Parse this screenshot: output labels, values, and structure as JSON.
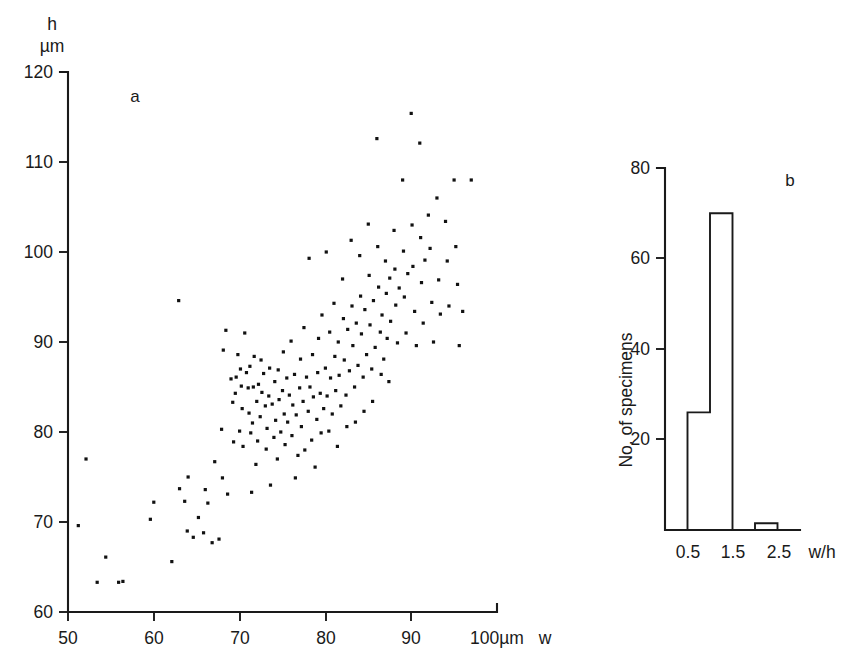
{
  "figure": {
    "background": "#ffffff",
    "ink": "#1a1a1a"
  },
  "panel_a": {
    "label": "a",
    "y_axis_name": "h",
    "y_axis_unit": "µm",
    "x_axis_unit_label": "100µm",
    "x_axis_name": "w",
    "y_ticks": [
      "120",
      "110",
      "100",
      "90",
      "80",
      "70",
      "60"
    ],
    "x_ticks": [
      "50",
      "60",
      "70",
      "80",
      "90"
    ]
  },
  "panel_b": {
    "label": "b",
    "y_axis_title": "No. of specimens",
    "x_axis_name": "w/h",
    "y_ticks": [
      "80",
      "60",
      "40",
      "20"
    ],
    "x_ticks": [
      "0.5",
      "1.5",
      "2.5"
    ]
  },
  "chart_data": [
    {
      "type": "scatter",
      "panel": "a",
      "title": "a",
      "xlabel": "w",
      "ylabel": "h",
      "xunit": "µm",
      "yunit": "µm",
      "xlim": [
        50,
        100
      ],
      "ylim": [
        60,
        120
      ],
      "xticks": [
        50,
        60,
        70,
        80,
        90,
        100
      ],
      "yticks": [
        60,
        70,
        80,
        90,
        100,
        110,
        120
      ],
      "grid": false,
      "legend": "none",
      "marker": "small filled square",
      "n_points": 196,
      "points": [
        [
          51.2,
          69.6
        ],
        [
          52.1,
          77.0
        ],
        [
          53.4,
          63.3
        ],
        [
          54.4,
          66.1
        ],
        [
          55.9,
          63.3
        ],
        [
          56.4,
          63.4
        ],
        [
          59.6,
          70.3
        ],
        [
          60.0,
          72.2
        ],
        [
          62.1,
          65.6
        ],
        [
          62.9,
          94.6
        ],
        [
          63.0,
          73.7
        ],
        [
          63.6,
          72.3
        ],
        [
          63.9,
          69.0
        ],
        [
          64.0,
          75.0
        ],
        [
          64.6,
          68.3
        ],
        [
          65.2,
          70.5
        ],
        [
          65.8,
          68.8
        ],
        [
          66.0,
          73.6
        ],
        [
          66.3,
          72.1
        ],
        [
          66.8,
          67.7
        ],
        [
          67.1,
          76.7
        ],
        [
          67.6,
          68.1
        ],
        [
          67.9,
          80.3
        ],
        [
          68.0,
          74.9
        ],
        [
          68.1,
          89.1
        ],
        [
          68.4,
          91.3
        ],
        [
          68.6,
          73.1
        ],
        [
          69.0,
          85.9
        ],
        [
          69.2,
          83.3
        ],
        [
          69.3,
          78.9
        ],
        [
          69.5,
          84.3
        ],
        [
          69.6,
          86.1
        ],
        [
          69.8,
          88.6
        ],
        [
          70.0,
          80.1
        ],
        [
          70.1,
          87.0
        ],
        [
          70.2,
          85.1
        ],
        [
          70.3,
          82.6
        ],
        [
          70.4,
          78.4
        ],
        [
          70.6,
          91.0
        ],
        [
          70.8,
          86.6
        ],
        [
          71.0,
          84.9
        ],
        [
          71.1,
          82.1
        ],
        [
          71.2,
          87.3
        ],
        [
          71.3,
          79.9
        ],
        [
          71.4,
          73.3
        ],
        [
          71.5,
          81.0
        ],
        [
          71.6,
          85.0
        ],
        [
          71.7,
          88.4
        ],
        [
          71.9,
          76.4
        ],
        [
          72.0,
          83.4
        ],
        [
          72.1,
          79.0
        ],
        [
          72.2,
          85.3
        ],
        [
          72.4,
          81.7
        ],
        [
          72.5,
          88.0
        ],
        [
          72.6,
          84.4
        ],
        [
          72.8,
          86.5
        ],
        [
          73.0,
          82.9
        ],
        [
          73.1,
          78.1
        ],
        [
          73.2,
          80.4
        ],
        [
          73.4,
          84.0
        ],
        [
          73.5,
          87.1
        ],
        [
          73.6,
          74.1
        ],
        [
          73.8,
          83.1
        ],
        [
          74.0,
          79.4
        ],
        [
          74.1,
          85.6
        ],
        [
          74.2,
          81.3
        ],
        [
          74.4,
          77.0
        ],
        [
          74.5,
          86.9
        ],
        [
          74.6,
          83.6
        ],
        [
          74.8,
          80.0
        ],
        [
          75.0,
          84.6
        ],
        [
          75.1,
          88.9
        ],
        [
          75.2,
          82.0
        ],
        [
          75.3,
          78.6
        ],
        [
          75.5,
          86.0
        ],
        [
          75.6,
          81.1
        ],
        [
          75.8,
          84.1
        ],
        [
          76.0,
          90.1
        ],
        [
          76.1,
          79.6
        ],
        [
          76.2,
          83.0
        ],
        [
          76.4,
          86.4
        ],
        [
          76.5,
          74.9
        ],
        [
          76.6,
          81.9
        ],
        [
          76.8,
          77.4
        ],
        [
          77.0,
          84.9
        ],
        [
          77.1,
          88.1
        ],
        [
          77.2,
          80.6
        ],
        [
          77.4,
          83.4
        ],
        [
          77.5,
          91.6
        ],
        [
          77.6,
          78.0
        ],
        [
          77.8,
          86.1
        ],
        [
          78.0,
          82.3
        ],
        [
          78.1,
          99.3
        ],
        [
          78.2,
          85.0
        ],
        [
          78.4,
          79.1
        ],
        [
          78.5,
          88.6
        ],
        [
          78.6,
          83.9
        ],
        [
          78.8,
          76.1
        ],
        [
          79.0,
          81.4
        ],
        [
          79.1,
          86.6
        ],
        [
          79.2,
          90.4
        ],
        [
          79.4,
          84.3
        ],
        [
          79.5,
          79.9
        ],
        [
          79.6,
          93.0
        ],
        [
          79.8,
          82.6
        ],
        [
          80.0,
          87.1
        ],
        [
          80.1,
          100.0
        ],
        [
          80.2,
          84.0
        ],
        [
          80.4,
          80.1
        ],
        [
          80.5,
          91.1
        ],
        [
          80.6,
          86.0
        ],
        [
          80.8,
          82.0
        ],
        [
          81.0,
          94.3
        ],
        [
          81.1,
          88.4
        ],
        [
          81.2,
          84.6
        ],
        [
          81.4,
          78.4
        ],
        [
          81.5,
          90.0
        ],
        [
          81.6,
          86.3
        ],
        [
          81.8,
          82.9
        ],
        [
          82.0,
          97.0
        ],
        [
          82.1,
          92.6
        ],
        [
          82.2,
          88.0
        ],
        [
          82.4,
          84.1
        ],
        [
          82.5,
          80.6
        ],
        [
          82.6,
          91.4
        ],
        [
          82.8,
          86.8
        ],
        [
          83.0,
          101.3
        ],
        [
          83.1,
          94.0
        ],
        [
          83.2,
          89.6
        ],
        [
          83.4,
          85.0
        ],
        [
          83.5,
          81.1
        ],
        [
          83.6,
          92.1
        ],
        [
          83.8,
          87.4
        ],
        [
          84.0,
          99.6
        ],
        [
          84.1,
          95.1
        ],
        [
          84.2,
          90.9
        ],
        [
          84.4,
          86.1
        ],
        [
          84.5,
          82.3
        ],
        [
          84.6,
          93.6
        ],
        [
          84.8,
          88.6
        ],
        [
          85.0,
          103.1
        ],
        [
          85.1,
          97.4
        ],
        [
          85.2,
          91.9
        ],
        [
          85.4,
          87.0
        ],
        [
          85.5,
          83.4
        ],
        [
          85.6,
          94.6
        ],
        [
          85.8,
          89.4
        ],
        [
          86.0,
          112.6
        ],
        [
          86.1,
          100.6
        ],
        [
          86.2,
          96.1
        ],
        [
          86.4,
          91.1
        ],
        [
          86.5,
          86.4
        ],
        [
          86.6,
          93.0
        ],
        [
          86.8,
          88.1
        ],
        [
          87.0,
          99.0
        ],
        [
          87.1,
          95.4
        ],
        [
          87.2,
          90.4
        ],
        [
          87.4,
          85.6
        ],
        [
          87.5,
          97.1
        ],
        [
          87.6,
          92.3
        ],
        [
          88.0,
          102.4
        ],
        [
          88.1,
          98.1
        ],
        [
          88.2,
          94.1
        ],
        [
          88.4,
          89.9
        ],
        [
          88.6,
          96.0
        ],
        [
          89.0,
          108.0
        ],
        [
          89.1,
          100.1
        ],
        [
          89.2,
          95.0
        ],
        [
          89.4,
          91.0
        ],
        [
          89.6,
          97.6
        ],
        [
          90.0,
          115.4
        ],
        [
          90.1,
          103.0
        ],
        [
          90.2,
          98.4
        ],
        [
          90.4,
          93.4
        ],
        [
          90.6,
          89.6
        ],
        [
          91.0,
          112.1
        ],
        [
          91.1,
          101.6
        ],
        [
          91.2,
          96.6
        ],
        [
          91.4,
          92.1
        ],
        [
          91.6,
          99.1
        ],
        [
          92.0,
          104.1
        ],
        [
          92.2,
          100.4
        ],
        [
          92.4,
          94.4
        ],
        [
          92.6,
          90.0
        ],
        [
          93.0,
          106.0
        ],
        [
          93.2,
          96.9
        ],
        [
          93.4,
          93.1
        ],
        [
          94.0,
          103.4
        ],
        [
          94.2,
          99.0
        ],
        [
          94.4,
          94.0
        ],
        [
          95.0,
          108.0
        ],
        [
          95.2,
          100.6
        ],
        [
          95.4,
          96.4
        ],
        [
          95.6,
          89.6
        ],
        [
          96.0,
          93.4
        ],
        [
          97.0,
          108.0
        ]
      ]
    },
    {
      "type": "bar",
      "panel": "b",
      "title": "b",
      "xlabel": "w/h",
      "ylabel": "No. of specimens",
      "xlim": [
        0,
        3.0
      ],
      "ylim": [
        0,
        80
      ],
      "yticks": [
        20,
        40,
        60,
        80
      ],
      "xticks": [
        0.5,
        1.5,
        2.5
      ],
      "grid": false,
      "legend": "none",
      "bin_edges": [
        0.0,
        0.5,
        1.0,
        1.5,
        2.0,
        2.5,
        3.0
      ],
      "categories": [
        "0.0-0.5",
        "0.5-1.0",
        "1.0-1.5",
        "1.5-2.0",
        "2.0-2.5",
        "2.5-3.0"
      ],
      "values": [
        0,
        26,
        70,
        0,
        1.5,
        0
      ]
    }
  ]
}
